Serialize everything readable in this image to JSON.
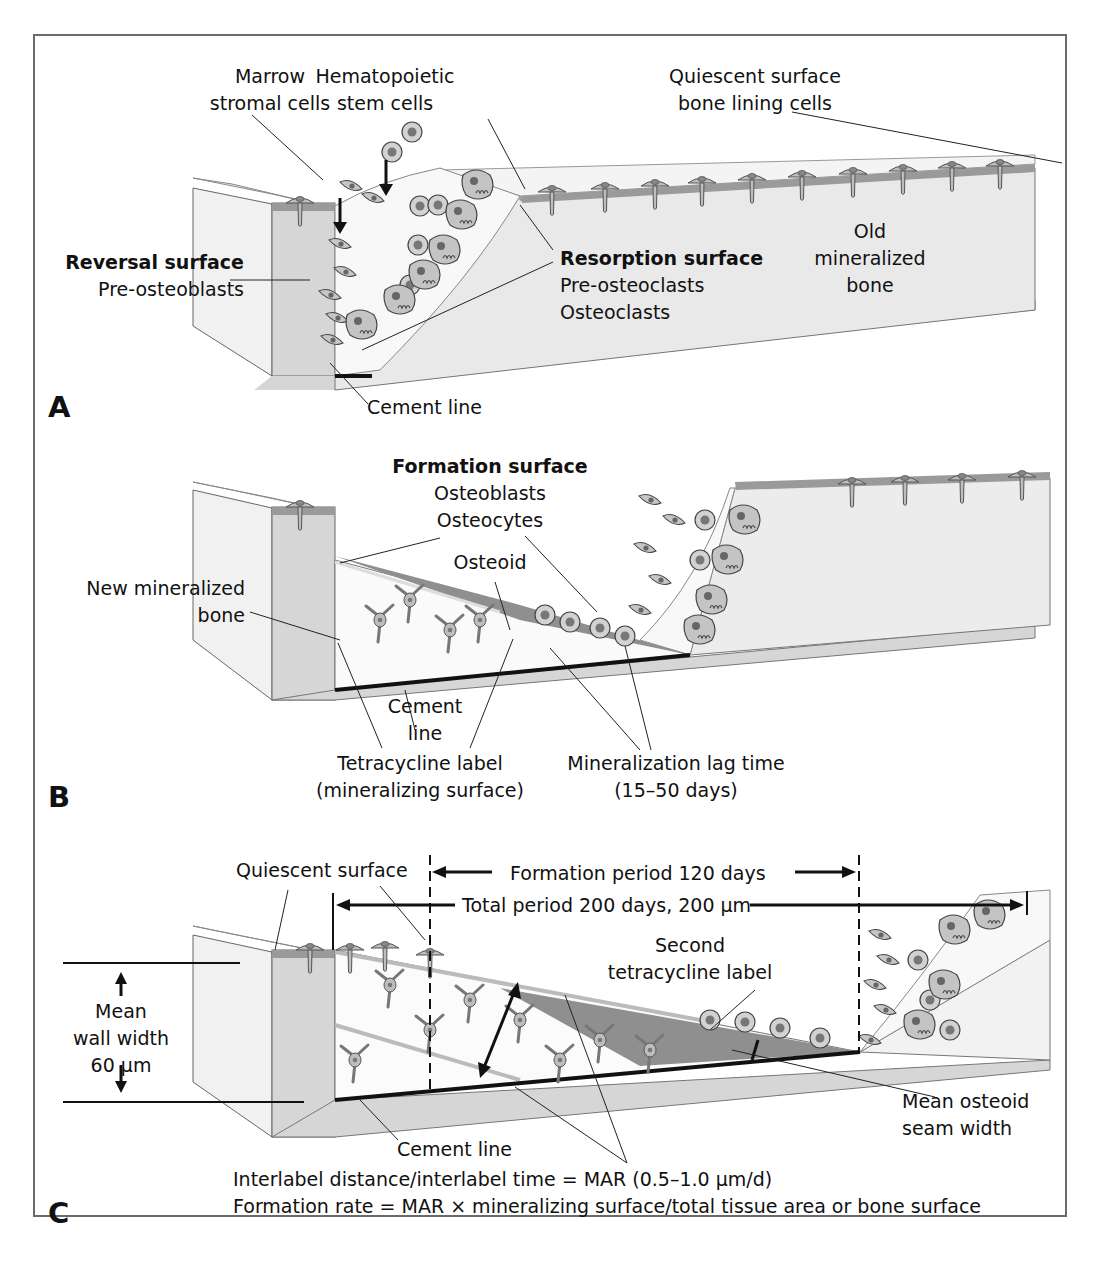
{
  "figure": {
    "panels": [
      {
        "letter": "A",
        "labels": {
          "marrow_stromal": [
            "Marrow",
            "stromal cells"
          ],
          "hematopoietic": [
            "Hematopoietic",
            "stem cells"
          ],
          "quiescent": [
            "Quiescent surface",
            "bone lining cells"
          ],
          "reversal_title": "Reversal surface",
          "reversal_sub": "Pre-osteoblasts",
          "resorption_title": "Resorption surface",
          "resorption_sub": [
            "Pre-osteoclasts",
            "Osteoclasts"
          ],
          "old_bone": [
            "Old",
            "mineralized",
            "bone"
          ],
          "cement_line": "Cement line"
        }
      },
      {
        "letter": "B",
        "labels": {
          "formation_title": "Formation surface",
          "formation_sub": [
            "Osteoblasts",
            "Osteocytes"
          ],
          "osteoid": "Osteoid",
          "new_bone": [
            "New mineralized",
            "bone"
          ],
          "cement_line": [
            "Cement",
            "line"
          ],
          "tetracycline": [
            "Tetracycline label",
            "(mineralizing surface)"
          ],
          "lag_time": [
            "Mineralization lag time",
            "(15–50 days)"
          ]
        }
      },
      {
        "letter": "C",
        "labels": {
          "quiescent": "Quiescent surface",
          "formation_period": "Formation period 120 days",
          "total_period": "Total period 200 days, 200 μm",
          "second_label": [
            "Second",
            "tetracycline label"
          ],
          "wall_width": [
            "Mean",
            "wall width",
            "60 μm"
          ],
          "osteoid_seam": [
            "Mean osteoid",
            "seam width"
          ],
          "cement_line": "Cement line",
          "mar_formula": "Interlabel distance/interlabel time = MAR (0.5–1.0 μm/d)",
          "formation_rate": "Formation rate = MAR × mineralizing surface/total tissue area or bone surface"
        }
      }
    ]
  },
  "colors": {
    "bone_side": "#d9d9d9",
    "bone_front": "#ececec",
    "surface_layer": "#9a9a9a",
    "osteoid": "#8f8f8f",
    "marrow": "#f7f7f7",
    "cell_fill": "#c8c8c8",
    "cell_nucleus": "#7a7a7a",
    "cement_line": "#111111"
  }
}
